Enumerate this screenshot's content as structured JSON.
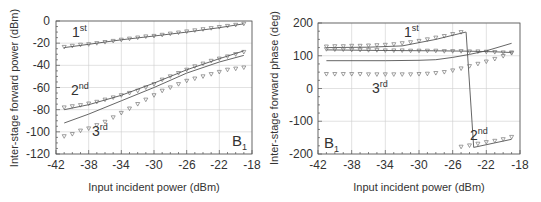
{
  "chart_data": [
    {
      "type": "line",
      "title": "",
      "panel_label": "B",
      "panel_label_sub": "1",
      "xlabel": "Input incident power (dBm)",
      "ylabel": "Inter-stage forward power (dBm)",
      "xlim": [
        -42,
        -18
      ],
      "ylim": [
        -120,
        0
      ],
      "xticks": [
        -42,
        -38,
        -34,
        -30,
        -26,
        -22,
        -18
      ],
      "yticks": [
        0,
        -20,
        -40,
        -60,
        -80,
        -100,
        -120
      ],
      "grid": true,
      "series": [
        {
          "name": "1st (measured)",
          "label": "1",
          "sup": "st",
          "style": "markers",
          "x": [
            -41,
            -40,
            -39,
            -38,
            -37,
            -36,
            -35,
            -34,
            -33,
            -32,
            -31,
            -30,
            -29,
            -28,
            -27,
            -26,
            -25,
            -24,
            -23,
            -22,
            -21,
            -20,
            -19
          ],
          "values": [
            -23.5,
            -22.5,
            -21.5,
            -21,
            -20,
            -19,
            -18,
            -17,
            -16,
            -15,
            -14,
            -13.5,
            -12.5,
            -11.5,
            -10.5,
            -9.5,
            -8.5,
            -7.5,
            -6.5,
            -5.5,
            -4.5,
            -3.5,
            -2.5
          ]
        },
        {
          "name": "1st (simulated)",
          "style": "line",
          "x": [
            -41,
            -38,
            -34,
            -30,
            -26,
            -22,
            -19
          ],
          "values": [
            -24,
            -21,
            -17,
            -13.5,
            -10,
            -6,
            -2.5
          ]
        },
        {
          "name": "2nd (measured)",
          "label": "2",
          "sup": "nd",
          "style": "markers",
          "x": [
            -41,
            -40,
            -39,
            -38,
            -37,
            -36,
            -35,
            -34,
            -33,
            -32,
            -31,
            -30,
            -29,
            -28,
            -27,
            -26,
            -25,
            -24,
            -23,
            -22,
            -21,
            -20,
            -19
          ],
          "values": [
            -78,
            -77,
            -76,
            -74.5,
            -73,
            -71,
            -69,
            -67,
            -65,
            -63,
            -60,
            -57,
            -53,
            -50,
            -47,
            -44,
            -41,
            -38.5,
            -36,
            -34,
            -32,
            -30,
            -28
          ]
        },
        {
          "name": "2nd (simulated)",
          "style": "line",
          "x": [
            -41,
            -38,
            -34,
            -30,
            -26,
            -22,
            -19
          ],
          "values": [
            -80,
            -75.5,
            -67,
            -56,
            -44,
            -34,
            -27
          ]
        },
        {
          "name": "3rd (measured)",
          "label": "3",
          "sup": "rd",
          "style": "markers",
          "x": [
            -41,
            -40,
            -39,
            -38,
            -37,
            -36,
            -35,
            -34,
            -33,
            -32,
            -31,
            -30,
            -29,
            -28,
            -27,
            -26,
            -25,
            -24,
            -23,
            -22,
            -21,
            -20,
            -19
          ],
          "values": [
            -104,
            -102,
            -99,
            -97,
            -94,
            -91,
            -87,
            -83,
            -79,
            -75,
            -71,
            -67,
            -63,
            -60,
            -57,
            -54,
            -52,
            -50,
            -48,
            -46,
            -44,
            -43,
            -42
          ]
        },
        {
          "name": "3rd (simulated)",
          "style": "line",
          "x": [
            -41,
            -38,
            -34,
            -30,
            -26,
            -22,
            -19
          ],
          "values": [
            -92,
            -84,
            -72,
            -60,
            -47,
            -37,
            -31
          ]
        }
      ]
    },
    {
      "type": "line",
      "title": "",
      "panel_label": "B",
      "panel_label_sub": "1",
      "xlabel": "Input incident power (dBm)",
      "ylabel": "Inter-stage forward phase (deg)",
      "xlim": [
        -42,
        -18
      ],
      "ylim": [
        -200,
        200
      ],
      "xticks": [
        -42,
        -38,
        -34,
        -30,
        -26,
        -22,
        -18
      ],
      "yticks": [
        200,
        100,
        0,
        -100,
        -200
      ],
      "grid": true,
      "series": [
        {
          "name": "1st (measured)",
          "label": "1",
          "sup": "st",
          "style": "markers",
          "x": [
            -41,
            -40,
            -39,
            -38,
            -37,
            -36,
            -35,
            -34,
            -33,
            -32,
            -31,
            -30,
            -29,
            -28,
            -27,
            -26,
            -25
          ],
          "values": [
            128,
            129,
            129,
            130,
            130,
            131,
            132,
            133,
            135,
            138,
            141,
            145,
            150,
            155,
            160,
            166,
            172
          ]
        },
        {
          "name": "1st (simulated)",
          "style": "line",
          "x": [
            -41,
            -36,
            -32,
            -28,
            -24.5,
            -24.4,
            -23.5,
            -19
          ],
          "values": [
            125,
            126,
            130,
            150,
            172,
            172,
            -180,
            -155
          ]
        },
        {
          "name": "flat trace (measured)",
          "style": "markers",
          "x": [
            -41,
            -40,
            -39,
            -38,
            -37,
            -36,
            -35,
            -34,
            -33,
            -32,
            -31,
            -30,
            -29,
            -28,
            -27,
            -26,
            -25,
            -24,
            -23,
            -22,
            -21,
            -20,
            -19
          ],
          "values": [
            120,
            119,
            119,
            118,
            118,
            117,
            117,
            116,
            116,
            116,
            115,
            115,
            115,
            115,
            114,
            114,
            114,
            113,
            113,
            112,
            111,
            110,
            110
          ]
        },
        {
          "name": "flat trace (simulated)",
          "style": "line",
          "x": [
            -41,
            -34,
            -28,
            -24,
            -21,
            -19
          ],
          "values": [
            118,
            116,
            115,
            114,
            112,
            110
          ]
        },
        {
          "name": "3rd (measured)",
          "label": "3",
          "sup": "rd",
          "style": "markers",
          "x": [
            -41,
            -40,
            -39,
            -38,
            -37,
            -36,
            -35,
            -34,
            -33,
            -32,
            -31,
            -30,
            -29,
            -28,
            -27,
            -26,
            -25,
            -24,
            -23,
            -22,
            -21,
            -20,
            -19
          ],
          "values": [
            44,
            44,
            44,
            44,
            44,
            43,
            43,
            43,
            43,
            43,
            43,
            44,
            45,
            47,
            50,
            55,
            61,
            68,
            75,
            82,
            90,
            99,
            108
          ]
        },
        {
          "name": "3rd (simulated)",
          "style": "line",
          "x": [
            -41,
            -34,
            -30,
            -28,
            -26,
            -24,
            -22,
            -19
          ],
          "values": [
            85,
            85,
            86,
            88,
            95,
            104,
            115,
            138
          ]
        },
        {
          "name": "2nd (measured)",
          "label": "2",
          "sup": "nd",
          "style": "markers",
          "x": [
            -25,
            -24,
            -23,
            -22,
            -21,
            -20,
            -19
          ],
          "values": [
            -178,
            -174,
            -169,
            -164,
            -160,
            -155,
            -148
          ]
        }
      ]
    }
  ],
  "left_panel": {
    "ylabel": "Inter-stage forward power (dBm)",
    "xlabel": "Input incident power (dBm)",
    "yticks": [
      "0",
      "-20",
      "-40",
      "-60",
      "-80",
      "-100",
      "-120"
    ],
    "xticks": [
      "-42",
      "-38",
      "-34",
      "-30",
      "-26",
      "-22",
      "-18"
    ],
    "labels": {
      "first": "1",
      "first_sup": "st",
      "second": "2",
      "second_sup": "nd",
      "third": "3",
      "third_sup": "rd",
      "panel": "B",
      "panel_sub": "1"
    }
  },
  "right_panel": {
    "ylabel": "Inter-stage forward phase (deg)",
    "xlabel": "Input incident power (dBm)",
    "yticks": [
      "200",
      "100",
      "0",
      "-100",
      "-200"
    ],
    "xticks": [
      "-42",
      "-38",
      "-34",
      "-30",
      "-26",
      "-22",
      "-18"
    ],
    "labels": {
      "first": "1",
      "first_sup": "st",
      "second": "2",
      "second_sup": "nd",
      "third": "3",
      "third_sup": "rd",
      "panel": "B",
      "panel_sub": "1"
    }
  }
}
